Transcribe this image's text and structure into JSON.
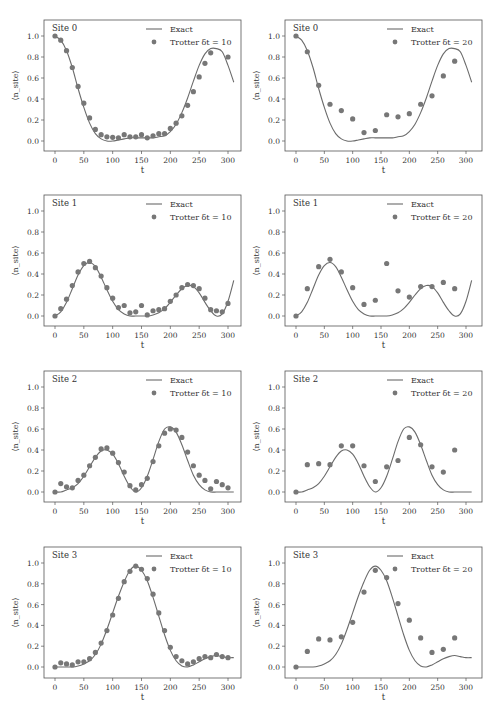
{
  "figure": {
    "colors": {
      "exact_line": "#6b6b6b",
      "trotter_marker": "#777777",
      "axes": "#555555",
      "text": "#333333"
    },
    "y_label": "⟨n_site⟩",
    "x_label": "t"
  },
  "chart_data": [
    {
      "type": "line+scatter",
      "panel": "row1-left",
      "title": "Site 0",
      "xlabel": "t",
      "ylabel": "⟨n_site⟩",
      "xlim": [
        -18,
        325
      ],
      "ylim": [
        -0.1,
        1.15
      ],
      "xticks": [
        0,
        50,
        100,
        150,
        200,
        250,
        300
      ],
      "yticks": [
        0.0,
        0.2,
        0.4,
        0.6,
        0.8,
        1.0
      ],
      "legend": [
        "Exact",
        "Trotter δt = 10"
      ],
      "legend_position": "upper right",
      "grid": false,
      "exact": {
        "x": [
          0,
          10,
          20,
          30,
          40,
          50,
          60,
          70,
          80,
          90,
          100,
          110,
          120,
          130,
          140,
          150,
          160,
          170,
          180,
          190,
          200,
          210,
          220,
          230,
          240,
          250,
          260,
          270,
          280,
          290,
          300,
          310
        ],
        "y": [
          1.0,
          0.96,
          0.86,
          0.7,
          0.5,
          0.32,
          0.17,
          0.07,
          0.02,
          0.0,
          0.0,
          0.01,
          0.02,
          0.03,
          0.03,
          0.03,
          0.03,
          0.03,
          0.04,
          0.05,
          0.09,
          0.16,
          0.27,
          0.41,
          0.57,
          0.72,
          0.83,
          0.88,
          0.88,
          0.85,
          0.72,
          0.56
        ]
      },
      "trotter": {
        "name": "Trotter δt = 10",
        "x": [
          0,
          10,
          20,
          30,
          40,
          50,
          60,
          70,
          80,
          90,
          100,
          110,
          120,
          130,
          140,
          150,
          160,
          170,
          180,
          190,
          200,
          210,
          220,
          230,
          240,
          250,
          260,
          270,
          300
        ],
        "y": [
          1.0,
          0.96,
          0.86,
          0.7,
          0.52,
          0.36,
          0.22,
          0.11,
          0.06,
          0.04,
          0.035,
          0.03,
          0.06,
          0.04,
          0.04,
          0.06,
          0.03,
          0.05,
          0.07,
          0.07,
          0.12,
          0.17,
          0.24,
          0.34,
          0.47,
          0.61,
          0.74,
          0.84,
          0.8
        ]
      }
    },
    {
      "type": "line+scatter",
      "panel": "row1-right",
      "title": "Site 0",
      "xlabel": "t",
      "ylabel": "⟨n_site⟩",
      "xlim": [
        -18,
        325
      ],
      "ylim": [
        -0.1,
        1.15
      ],
      "xticks": [
        0,
        50,
        100,
        150,
        200,
        250,
        300
      ],
      "yticks": [
        0.0,
        0.2,
        0.4,
        0.6,
        0.8,
        1.0
      ],
      "legend": [
        "Exact",
        "Trotter δt = 20"
      ],
      "legend_position": "upper right",
      "grid": false,
      "exact": "same as row1-left",
      "trotter": {
        "name": "Trotter δt = 20",
        "x": [
          0,
          20,
          40,
          60,
          80,
          100,
          120,
          140,
          160,
          180,
          200,
          220,
          240,
          260,
          280
        ],
        "y": [
          1.0,
          0.85,
          0.53,
          0.35,
          0.29,
          0.21,
          0.08,
          0.1,
          0.25,
          0.23,
          0.26,
          0.35,
          0.43,
          0.62,
          0.76
        ]
      }
    },
    {
      "type": "line+scatter",
      "panel": "row2-left",
      "title": "Site 1",
      "xlabel": "t",
      "ylabel": "⟨n_site⟩",
      "xlim": [
        -18,
        325
      ],
      "ylim": [
        -0.1,
        1.15
      ],
      "xticks": [
        0,
        50,
        100,
        150,
        200,
        250,
        300
      ],
      "yticks": [
        0.0,
        0.2,
        0.4,
        0.6,
        0.8,
        1.0
      ],
      "legend": [
        "Exact",
        "Trotter δt = 10"
      ],
      "legend_position": "upper right",
      "grid": false,
      "exact": {
        "x": [
          0,
          10,
          20,
          30,
          40,
          50,
          60,
          70,
          80,
          90,
          100,
          110,
          120,
          130,
          140,
          150,
          160,
          170,
          180,
          190,
          200,
          210,
          220,
          230,
          240,
          250,
          260,
          270,
          280,
          290,
          300,
          310
        ],
        "y": [
          0.0,
          0.04,
          0.13,
          0.26,
          0.39,
          0.48,
          0.51,
          0.47,
          0.37,
          0.25,
          0.14,
          0.06,
          0.02,
          0.0,
          0.0,
          0.0,
          0.0,
          0.01,
          0.03,
          0.07,
          0.13,
          0.2,
          0.26,
          0.29,
          0.28,
          0.22,
          0.13,
          0.05,
          0.0,
          0.02,
          0.14,
          0.34
        ]
      },
      "trotter": {
        "name": "Trotter δt = 10",
        "x": [
          0,
          10,
          20,
          30,
          40,
          50,
          60,
          70,
          80,
          90,
          100,
          110,
          120,
          130,
          140,
          150,
          160,
          170,
          180,
          190,
          200,
          210,
          220,
          230,
          240,
          250,
          260,
          270,
          280,
          290,
          300
        ],
        "y": [
          0.0,
          0.07,
          0.16,
          0.29,
          0.42,
          0.5,
          0.52,
          0.46,
          0.38,
          0.27,
          0.17,
          0.08,
          0.1,
          0.03,
          0.04,
          0.1,
          0.01,
          0.05,
          0.06,
          0.07,
          0.14,
          0.2,
          0.27,
          0.3,
          0.29,
          0.26,
          0.17,
          0.06,
          0.05,
          0.04,
          0.12
        ]
      }
    },
    {
      "type": "line+scatter",
      "panel": "row2-right",
      "title": "Site 1",
      "xlabel": "t",
      "ylabel": "⟨n_site⟩",
      "xlim": [
        -18,
        325
      ],
      "ylim": [
        -0.1,
        1.15
      ],
      "xticks": [
        0,
        50,
        100,
        150,
        200,
        250,
        300
      ],
      "yticks": [
        0.0,
        0.2,
        0.4,
        0.6,
        0.8,
        1.0
      ],
      "legend": [
        "Exact",
        "Trotter δt = 20"
      ],
      "legend_position": "upper right",
      "grid": false,
      "exact": "same as row2-left",
      "trotter": {
        "name": "Trotter δt = 20",
        "x": [
          0,
          20,
          40,
          60,
          80,
          100,
          120,
          140,
          160,
          180,
          200,
          220,
          240,
          260,
          280
        ],
        "y": [
          0.0,
          0.26,
          0.47,
          0.54,
          0.42,
          0.27,
          0.11,
          0.15,
          0.5,
          0.24,
          0.18,
          0.28,
          0.28,
          0.32,
          0.26
        ]
      }
    },
    {
      "type": "line+scatter",
      "panel": "row3-left",
      "title": "Site 2",
      "xlabel": "t",
      "ylabel": "⟨n_site⟩",
      "xlim": [
        -18,
        325
      ],
      "ylim": [
        -0.1,
        1.15
      ],
      "xticks": [
        0,
        50,
        100,
        150,
        200,
        250,
        300
      ],
      "yticks": [
        0.0,
        0.2,
        0.4,
        0.6,
        0.8,
        1.0
      ],
      "legend": [
        "Exact",
        "Trotter δt = 10"
      ],
      "legend_position": "upper right",
      "grid": false,
      "exact": {
        "x": [
          0,
          10,
          20,
          30,
          40,
          50,
          60,
          70,
          80,
          90,
          100,
          110,
          120,
          130,
          140,
          150,
          160,
          170,
          180,
          190,
          200,
          210,
          220,
          230,
          240,
          250,
          260,
          270,
          280,
          290,
          300,
          310
        ],
        "y": [
          0.0,
          0.0,
          0.02,
          0.04,
          0.08,
          0.15,
          0.24,
          0.33,
          0.39,
          0.4,
          0.36,
          0.27,
          0.15,
          0.05,
          0.0,
          0.04,
          0.15,
          0.31,
          0.48,
          0.6,
          0.62,
          0.57,
          0.45,
          0.3,
          0.16,
          0.07,
          0.02,
          0.0,
          0.0,
          0.0,
          0.0,
          0.0
        ]
      },
      "trotter": {
        "name": "Trotter δt = 10",
        "x": [
          0,
          10,
          20,
          30,
          40,
          50,
          60,
          70,
          80,
          90,
          100,
          110,
          120,
          130,
          140,
          150,
          160,
          170,
          180,
          190,
          200,
          210,
          220,
          230,
          240,
          250,
          260,
          270,
          280,
          290,
          300
        ],
        "y": [
          0.0,
          0.08,
          0.05,
          0.04,
          0.11,
          0.16,
          0.25,
          0.33,
          0.41,
          0.42,
          0.37,
          0.28,
          0.19,
          0.06,
          0.02,
          0.07,
          0.13,
          0.29,
          0.44,
          0.56,
          0.6,
          0.59,
          0.52,
          0.38,
          0.25,
          0.16,
          0.11,
          0.03,
          0.1,
          0.07,
          0.04
        ]
      }
    },
    {
      "type": "line+scatter",
      "panel": "row3-right",
      "title": "Site 2",
      "xlabel": "t",
      "ylabel": "⟨n_site⟩",
      "xlim": [
        -18,
        325
      ],
      "ylim": [
        -0.1,
        1.15
      ],
      "xticks": [
        0,
        50,
        100,
        150,
        200,
        250,
        300
      ],
      "yticks": [
        0.0,
        0.2,
        0.4,
        0.6,
        0.8,
        1.0
      ],
      "legend": [
        "Exact",
        "Trotter δt = 20"
      ],
      "legend_position": "upper right",
      "grid": false,
      "exact": "same as row3-left",
      "trotter": {
        "name": "Trotter δt = 20",
        "x": [
          0,
          20,
          40,
          60,
          80,
          100,
          120,
          140,
          160,
          180,
          200,
          220,
          240,
          260,
          280
        ],
        "y": [
          0.0,
          0.26,
          0.27,
          0.26,
          0.44,
          0.44,
          0.25,
          0.1,
          0.24,
          0.3,
          0.52,
          0.45,
          0.24,
          0.19,
          0.4
        ]
      }
    },
    {
      "type": "line+scatter",
      "panel": "row4-left",
      "title": "Site 3",
      "xlabel": "t",
      "ylabel": "⟨n_site⟩",
      "xlim": [
        -18,
        325
      ],
      "ylim": [
        -0.1,
        1.15
      ],
      "xticks": [
        0,
        50,
        100,
        150,
        200,
        250,
        300
      ],
      "yticks": [
        0.0,
        0.2,
        0.4,
        0.6,
        0.8,
        1.0
      ],
      "legend": [
        "Exact",
        "Trotter δt = 10"
      ],
      "legend_position": "upper right",
      "grid": false,
      "exact": {
        "x": [
          0,
          10,
          20,
          30,
          40,
          50,
          60,
          70,
          80,
          90,
          100,
          110,
          120,
          130,
          140,
          150,
          160,
          170,
          180,
          190,
          200,
          210,
          220,
          230,
          240,
          250,
          260,
          270,
          280,
          290,
          300,
          310
        ],
        "y": [
          0.0,
          0.0,
          0.0,
          0.0,
          0.01,
          0.03,
          0.06,
          0.12,
          0.22,
          0.36,
          0.52,
          0.68,
          0.82,
          0.93,
          0.97,
          0.93,
          0.83,
          0.67,
          0.49,
          0.31,
          0.16,
          0.06,
          0.01,
          0.0,
          0.02,
          0.05,
          0.08,
          0.1,
          0.11,
          0.1,
          0.09,
          0.09
        ]
      },
      "trotter": {
        "name": "Trotter δt = 10",
        "x": [
          0,
          10,
          20,
          30,
          40,
          50,
          60,
          70,
          80,
          90,
          100,
          110,
          120,
          130,
          140,
          150,
          160,
          170,
          180,
          190,
          200,
          210,
          220,
          230,
          240,
          250,
          260,
          270,
          280,
          290,
          300
        ],
        "y": [
          0.0,
          0.04,
          0.03,
          0.02,
          0.05,
          0.05,
          0.08,
          0.14,
          0.23,
          0.35,
          0.5,
          0.66,
          0.82,
          0.92,
          0.97,
          0.94,
          0.85,
          0.7,
          0.52,
          0.35,
          0.19,
          0.1,
          0.06,
          0.03,
          0.05,
          0.08,
          0.1,
          0.09,
          0.12,
          0.1,
          0.09
        ]
      }
    },
    {
      "type": "line+scatter",
      "panel": "row4-right",
      "title": "Site 3",
      "xlabel": "t",
      "ylabel": "⟨n_site⟩",
      "xlim": [
        -18,
        325
      ],
      "ylim": [
        -0.1,
        1.15
      ],
      "xticks": [
        0,
        50,
        100,
        150,
        200,
        250,
        300
      ],
      "yticks": [
        0.0,
        0.2,
        0.4,
        0.6,
        0.8,
        1.0
      ],
      "legend": [
        "Exact",
        "Trotter δt = 20"
      ],
      "legend_position": "upper right",
      "grid": false,
      "exact": "same as row4-left",
      "trotter": {
        "name": "Trotter δt = 20",
        "x": [
          0,
          20,
          40,
          60,
          80,
          100,
          120,
          140,
          160,
          180,
          200,
          220,
          240,
          260,
          280
        ],
        "y": [
          0.0,
          0.15,
          0.27,
          0.26,
          0.29,
          0.43,
          0.72,
          0.93,
          0.86,
          0.61,
          0.45,
          0.28,
          0.14,
          0.17,
          0.28
        ]
      }
    }
  ]
}
